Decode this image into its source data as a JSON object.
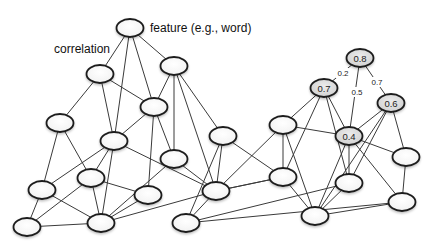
{
  "annotations": {
    "feature_label": "feature (e.g., word)",
    "correlation_label": "correlation"
  },
  "colors": {
    "node_stroke": "#1c1c1c",
    "edge": "#3a3a3a",
    "scored_node_fill": "#dcdcdc",
    "node_fill": "#ffffff"
  },
  "nodes": [
    {
      "id": "n_feature",
      "x": 130,
      "y": 28,
      "label": ""
    },
    {
      "id": "n2",
      "x": 100,
      "y": 74,
      "label": ""
    },
    {
      "id": "n3",
      "x": 174,
      "y": 66,
      "label": ""
    },
    {
      "id": "n4",
      "x": 154,
      "y": 107,
      "label": ""
    },
    {
      "id": "n5",
      "x": 60,
      "y": 123,
      "label": ""
    },
    {
      "id": "n6",
      "x": 114,
      "y": 141,
      "label": ""
    },
    {
      "id": "n7",
      "x": 91,
      "y": 178,
      "label": ""
    },
    {
      "id": "n8",
      "x": 42,
      "y": 190,
      "label": ""
    },
    {
      "id": "n9",
      "x": 174,
      "y": 159,
      "label": ""
    },
    {
      "id": "n10",
      "x": 148,
      "y": 195,
      "label": ""
    },
    {
      "id": "n11",
      "x": 27,
      "y": 227,
      "label": ""
    },
    {
      "id": "n12",
      "x": 101,
      "y": 223,
      "label": ""
    },
    {
      "id": "n13",
      "x": 223,
      "y": 136,
      "label": ""
    },
    {
      "id": "n14",
      "x": 216,
      "y": 191,
      "label": ""
    },
    {
      "id": "n15",
      "x": 186,
      "y": 223,
      "label": ""
    },
    {
      "id": "n16",
      "x": 283,
      "y": 125,
      "label": ""
    },
    {
      "id": "n17",
      "x": 283,
      "y": 177,
      "label": ""
    },
    {
      "id": "n18",
      "x": 315,
      "y": 216,
      "label": ""
    },
    {
      "id": "n19",
      "x": 349,
      "y": 183,
      "label": ""
    },
    {
      "id": "n20",
      "x": 406,
      "y": 157,
      "label": ""
    },
    {
      "id": "n21",
      "x": 402,
      "y": 202,
      "label": ""
    },
    {
      "id": "s08",
      "x": 360,
      "y": 58,
      "label": "0.8",
      "scored": true
    },
    {
      "id": "s07",
      "x": 324,
      "y": 88,
      "label": "0.7",
      "scored": true
    },
    {
      "id": "s06",
      "x": 391,
      "y": 103,
      "label": "0.6",
      "scored": true
    },
    {
      "id": "s04",
      "x": 349,
      "y": 136,
      "label": "0.4",
      "scored": true
    }
  ],
  "edges": [
    [
      "n_feature",
      "n2"
    ],
    [
      "n_feature",
      "n6"
    ],
    [
      "n_feature",
      "n4"
    ],
    [
      "n_feature",
      "n3"
    ],
    [
      "n2",
      "n5"
    ],
    [
      "n2",
      "n6"
    ],
    [
      "n2",
      "n4"
    ],
    [
      "n3",
      "n4"
    ],
    [
      "n3",
      "n9"
    ],
    [
      "n3",
      "n13"
    ],
    [
      "n3",
      "n14"
    ],
    [
      "n4",
      "n10"
    ],
    [
      "n4",
      "n9"
    ],
    [
      "n4",
      "n6"
    ],
    [
      "n5",
      "n8"
    ],
    [
      "n5",
      "n7"
    ],
    [
      "n6",
      "n8"
    ],
    [
      "n6",
      "n7"
    ],
    [
      "n6",
      "n12"
    ],
    [
      "n6",
      "n14"
    ],
    [
      "n7",
      "n10"
    ],
    [
      "n7",
      "n11"
    ],
    [
      "n7",
      "n12"
    ],
    [
      "n8",
      "n11"
    ],
    [
      "n8",
      "n12"
    ],
    [
      "n9",
      "n14"
    ],
    [
      "n9",
      "n12"
    ],
    [
      "n10",
      "n12"
    ],
    [
      "n11",
      "n12"
    ],
    [
      "n12",
      "n14"
    ],
    [
      "n13",
      "n14"
    ],
    [
      "n13",
      "n17"
    ],
    [
      "n13",
      "n15"
    ],
    [
      "n14",
      "n15"
    ],
    [
      "n14",
      "n16"
    ],
    [
      "n14",
      "n17"
    ],
    [
      "n15",
      "n19"
    ],
    [
      "n15",
      "n21"
    ],
    [
      "n16",
      "s07"
    ],
    [
      "n16",
      "n17"
    ],
    [
      "n16",
      "s04"
    ],
    [
      "n16",
      "n18"
    ],
    [
      "s07",
      "n17"
    ],
    [
      "s07",
      "n19"
    ],
    [
      "s07",
      "s04"
    ],
    [
      "n17",
      "n18"
    ],
    [
      "n17",
      "n14"
    ],
    [
      "n18",
      "n19"
    ],
    [
      "n18",
      "n21"
    ],
    [
      "n18",
      "s04"
    ],
    [
      "s04",
      "n19"
    ],
    [
      "s04",
      "n20"
    ],
    [
      "s04",
      "n21"
    ],
    [
      "s04",
      "s06"
    ],
    [
      "s06",
      "n19"
    ],
    [
      "s06",
      "n20"
    ],
    [
      "s06",
      "n18"
    ],
    [
      "n20",
      "n21"
    ]
  ],
  "weighted_edges": [
    {
      "from": "s08",
      "to": "s07",
      "weight": "0.2",
      "lx": 343,
      "ly": 73
    },
    {
      "from": "s08",
      "to": "s04",
      "weight": "0.5",
      "lx": 357,
      "ly": 92
    },
    {
      "from": "s08",
      "to": "s06",
      "weight": "0.7",
      "lx": 377,
      "ly": 82
    }
  ]
}
